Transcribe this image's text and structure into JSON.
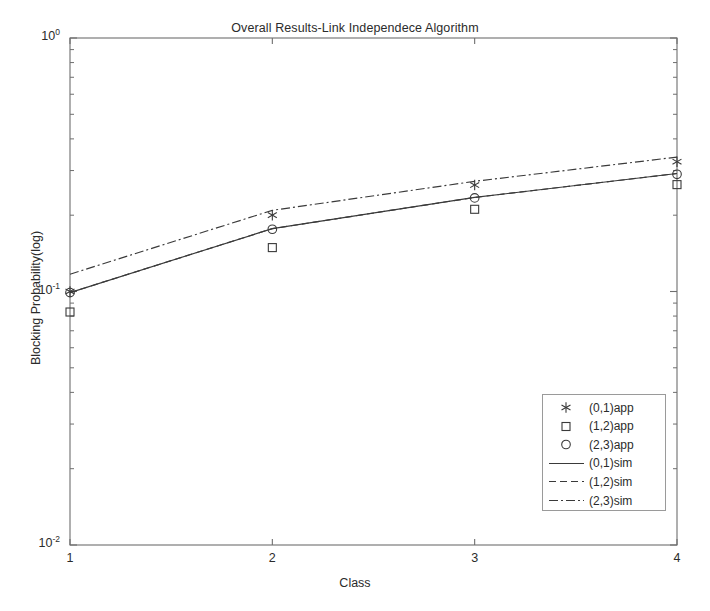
{
  "chart_data": {
    "type": "line",
    "title": "Overall Results-Link Independece Algorithm",
    "xlabel": "Class",
    "ylabel": "Blocking Probability(log)",
    "yscale": "log",
    "ylim": [
      0.01,
      1.0
    ],
    "xlim": [
      1,
      4
    ],
    "grid": false,
    "legend_position": "lower right",
    "x": [
      1,
      2,
      3,
      4
    ],
    "xticklabels": [
      "1",
      "2",
      "3",
      "4"
    ],
    "yticks": [
      0.01,
      0.1,
      1.0
    ],
    "yticklabels": [
      "10-2",
      "10-1",
      "100"
    ],
    "ytick_mantissa": [
      "10",
      "10",
      "10"
    ],
    "ytick_exponent": [
      "-2",
      "-1",
      "0"
    ],
    "series": [
      {
        "name": "(0,1)app",
        "marker": "star",
        "linestyle": "none",
        "values": [
          0.1,
          0.2,
          0.263,
          0.325
        ]
      },
      {
        "name": "(1,2)app",
        "marker": "square",
        "linestyle": "none",
        "values": [
          0.083,
          0.149,
          0.211,
          0.264
        ]
      },
      {
        "name": "(2,3)app",
        "marker": "circle",
        "linestyle": "none",
        "values": [
          0.099,
          0.176,
          0.234,
          0.29
        ]
      },
      {
        "name": "(0,1)sim",
        "marker": "none",
        "linestyle": "solid",
        "values": [
          0.099,
          0.177,
          0.235,
          0.292
        ]
      },
      {
        "name": "(1,2)sim",
        "marker": "none",
        "linestyle": "dashed",
        "values": [
          0.099,
          0.177,
          0.235,
          0.292
        ]
      },
      {
        "name": "(2,3)sim",
        "marker": "none",
        "linestyle": "dashdot",
        "values": [
          0.117,
          0.209,
          0.272,
          0.339
        ]
      }
    ]
  },
  "colors": {
    "axis": "#6e6e6e",
    "data": "#3a3a3a",
    "text": "#2b2b2b",
    "legend_border": "#9a9a9a",
    "background": "#ffffff"
  },
  "legend": {
    "items": [
      {
        "label": "(0,1)app",
        "symbol": "star-marker"
      },
      {
        "label": "(1,2)app",
        "symbol": "square-marker"
      },
      {
        "label": "(2,3)app",
        "symbol": "circle-marker"
      },
      {
        "label": "(0,1)sim",
        "symbol": "solid-line"
      },
      {
        "label": "(1,2)sim",
        "symbol": "dashed-line"
      },
      {
        "label": "(2,3)sim",
        "symbol": "dashdot-line"
      }
    ]
  }
}
